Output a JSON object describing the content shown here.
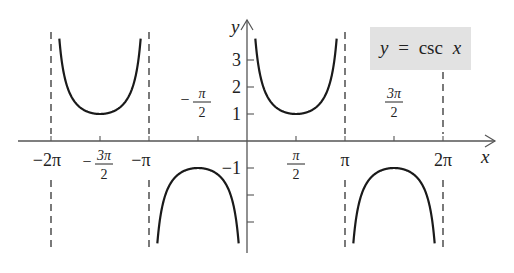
{
  "chart_data": {
    "type": "line",
    "title": "y = csc x",
    "legend_box": {
      "text_y": "y",
      "text_eq": "=",
      "text_fn": "csc",
      "text_x": "x",
      "background": "#e2e2e2"
    },
    "xlabel": "x",
    "ylabel": "y",
    "function": "csc(x)",
    "x_ticks": [
      {
        "value": -6.2832,
        "label": "−2π"
      },
      {
        "value": -4.7124,
        "num": "3π",
        "den": "2",
        "sign": "−"
      },
      {
        "value": -3.1416,
        "label": "−π"
      },
      {
        "value": -1.5708,
        "num": "π",
        "den": "2",
        "sign": "−"
      },
      {
        "value": 1.5708,
        "num": "π",
        "den": "2",
        "sign": ""
      },
      {
        "value": 3.1416,
        "label": "π"
      },
      {
        "value": 4.7124,
        "num": "3π",
        "den": "2",
        "sign": ""
      },
      {
        "value": 6.2832,
        "label": "2π"
      }
    ],
    "y_ticks": [
      {
        "value": 3,
        "label": "3"
      },
      {
        "value": 2,
        "label": "2"
      },
      {
        "value": 1,
        "label": "1"
      },
      {
        "value": -1,
        "label": "−1"
      },
      {
        "value": -2,
        "label": ""
      },
      {
        "value": -3,
        "label": ""
      }
    ],
    "asymptotes": [
      -6.2832,
      -3.1416,
      3.1416,
      6.2832
    ],
    "branches": [
      {
        "x_range": [
          -6.2832,
          -3.1416
        ],
        "min_point": [
          -4.7124,
          1
        ],
        "direction": "up"
      },
      {
        "x_range": [
          -3.1416,
          0
        ],
        "max_point": [
          -1.5708,
          -1
        ],
        "direction": "down"
      },
      {
        "x_range": [
          0,
          3.1416
        ],
        "min_point": [
          1.5708,
          1
        ],
        "direction": "up"
      },
      {
        "x_range": [
          3.1416,
          6.2832
        ],
        "max_point": [
          4.7124,
          -1
        ],
        "direction": "down"
      }
    ],
    "xlim": [
      -7.0,
      7.6
    ],
    "ylim": [
      -4.0,
      4.0
    ],
    "grid": false,
    "colors": {
      "curve": "#1a1a1a",
      "axis": "#555555",
      "asymptote": "#333333",
      "box": "#e2e2e2"
    }
  }
}
